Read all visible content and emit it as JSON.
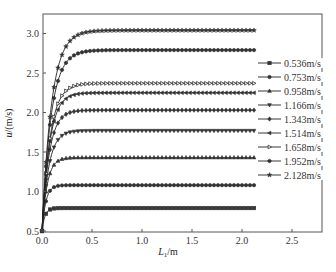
{
  "chart_data": {
    "type": "line",
    "title": "",
    "xlabel": "L_1/m",
    "xlabel_main": "L",
    "xlabel_sub": "1",
    "xlabel_unit": "/m",
    "ylabel": "u/(m/s)",
    "ylabel_main": "u",
    "ylabel_unit": "/(m/s)",
    "xlim": [
      0.0,
      2.8
    ],
    "ylim": [
      0.5,
      3.25
    ],
    "xticks": [
      0.0,
      0.5,
      1.0,
      1.5,
      2.0,
      2.5
    ],
    "xtick_labels": [
      "0.0",
      "0.5",
      "1.0",
      "1.5",
      "2.0",
      "2.5"
    ],
    "yticks": [
      0.5,
      1.0,
      1.5,
      2.0,
      2.5,
      3.0
    ],
    "ytick_labels": [
      "0.5",
      "1.0",
      "1.5",
      "2.0",
      "2.5",
      "3.0"
    ],
    "grid": false,
    "legend_position": "right, outside curves",
    "x_end": 2.13,
    "series": [
      {
        "name": "0.536m/s",
        "marker": "square",
        "plateau": 0.79,
        "rise_length": 0.12
      },
      {
        "name": "0.753m/s",
        "marker": "circle",
        "plateau": 1.08,
        "rise_length": 0.16
      },
      {
        "name": "0.958m/s",
        "marker": "triangle-up",
        "plateau": 1.43,
        "rise_length": 0.22
      },
      {
        "name": "1.166m/s",
        "marker": "triangle-down",
        "plateau": 1.77,
        "rise_length": 0.28
      },
      {
        "name": "1.343m/s",
        "marker": "diamond",
        "plateau": 2.03,
        "rise_length": 0.3
      },
      {
        "name": "1.514m/s",
        "marker": "triangle-left",
        "plateau": 2.25,
        "rise_length": 0.32
      },
      {
        "name": "1.658m/s",
        "marker": "triangle-right",
        "plateau": 2.37,
        "rise_length": 0.34
      },
      {
        "name": "1.952m/s",
        "marker": "hexagon",
        "plateau": 2.79,
        "rise_length": 0.38
      },
      {
        "name": "2.128m/s",
        "marker": "star",
        "plateau": 3.04,
        "rise_length": 0.4
      }
    ]
  }
}
